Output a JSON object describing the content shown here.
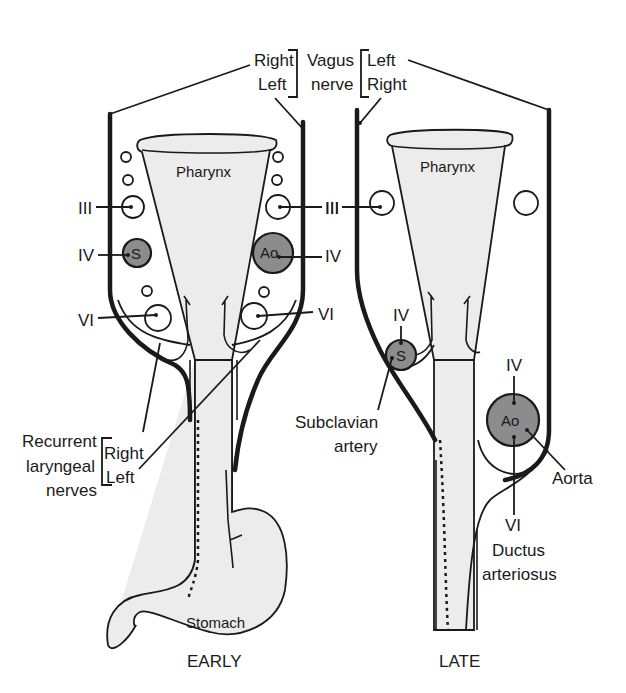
{
  "diagram": {
    "top_label": {
      "left_group": [
        "Right",
        "Left"
      ],
      "center": [
        "Vagus",
        "nerve"
      ],
      "right_group": [
        "Left",
        "Right"
      ]
    },
    "panels": {
      "early": {
        "caption": "EARLY",
        "pharynx_label": "Pharynx",
        "stomach_label": "Stomach",
        "arches_left": [
          "III",
          "IV",
          "VI"
        ],
        "arches_right": [
          "III",
          "IV",
          "VI"
        ],
        "vessel_left_iv": "S",
        "vessel_right_iv": "Ao",
        "recurrent_label": [
          "Recurrent",
          "laryngeal",
          "nerves"
        ],
        "recurrent_sides": [
          "Right",
          "Left"
        ]
      },
      "late": {
        "caption": "LATE",
        "pharynx_label": "Pharynx",
        "arch_iii": "III",
        "subclavian_arch": "IV",
        "subclavian_vessel": "S",
        "subclavian_label": [
          "Subclavian",
          "artery"
        ],
        "aorta_arch": "IV",
        "aorta_vessel": "Ao",
        "aorta_label": "Aorta",
        "ductus_arch": "VI",
        "ductus_label": [
          "Ductus",
          "arteriosus"
        ]
      }
    },
    "colors": {
      "ink": "#1a1a1a",
      "organ_fill": "#ececec",
      "vessel_fill": "#8c8c8c",
      "background": "#ffffff"
    }
  }
}
